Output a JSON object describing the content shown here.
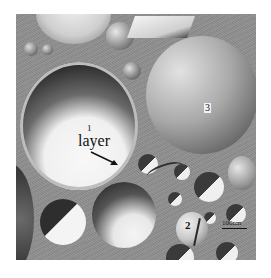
{
  "figure": {
    "type": "freeze-fracture electron micrograph",
    "labels": {
      "vesicle_1": "1",
      "layer": "layer",
      "vesicle_2": "2",
      "vesicle_3": "3"
    },
    "scale_bar": {
      "label": "100nm"
    },
    "colors": {
      "background_matrix": "#8f8f8f",
      "highlight": "#f2f2f2",
      "shadow": "#3a3a3a",
      "page": "#ffffff"
    }
  }
}
